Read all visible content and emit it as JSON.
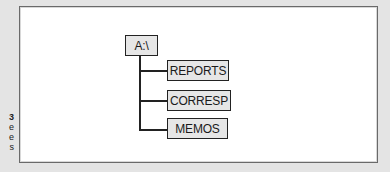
{
  "caption_fragment": {
    "lines": [
      "3",
      "e",
      "e",
      "s"
    ]
  },
  "diagram": {
    "type": "directory-tree",
    "root": {
      "label": "A:\\"
    },
    "children": [
      {
        "label": "REPORTS"
      },
      {
        "label": "CORRESP"
      },
      {
        "label": "MEMOS"
      }
    ],
    "colors": {
      "node_fill": "#e6e6e6",
      "node_border": "#222222",
      "connector": "#222222",
      "frame_border": "#6a6a6a",
      "page_background": "#e4e4e4"
    }
  }
}
